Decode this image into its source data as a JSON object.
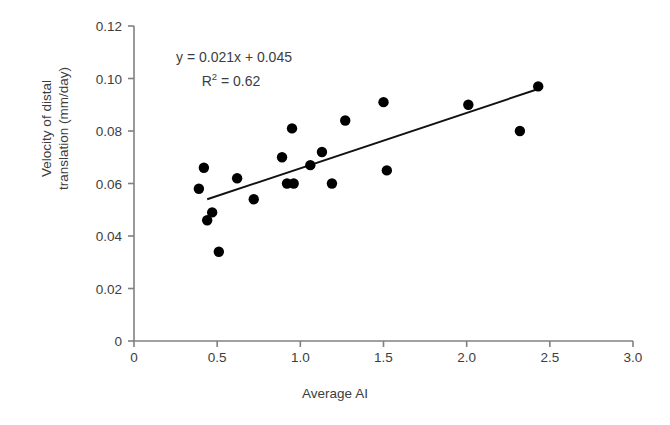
{
  "chart_data": {
    "type": "scatter",
    "title": "",
    "xlabel": "Average AI",
    "ylabel": "Velocity of distal translation (mm/day)",
    "ylabel_line1": "Velocity of distal",
    "ylabel_line2": "translation (mm/day)",
    "xlim": [
      0,
      3.0
    ],
    "ylim": [
      0,
      0.12
    ],
    "xticks": [
      "0",
      "0.5",
      "1.0",
      "1.5",
      "2.0",
      "2.5",
      "3.0"
    ],
    "xtick_values": [
      0,
      0.5,
      1.0,
      1.5,
      2.0,
      2.5,
      3.0
    ],
    "yticks": [
      "0",
      "0.02",
      "0.04",
      "0.06",
      "0.08",
      "0.10",
      "0.12"
    ],
    "ytick_values": [
      0,
      0.02,
      0.04,
      0.06,
      0.08,
      0.1,
      0.12
    ],
    "grid": false,
    "legend": null,
    "marker": "filled-circle",
    "marker_color": "#000000",
    "axis_color": "#808080",
    "points": [
      {
        "x": 0.39,
        "y": 0.058
      },
      {
        "x": 0.42,
        "y": 0.066
      },
      {
        "x": 0.44,
        "y": 0.046
      },
      {
        "x": 0.47,
        "y": 0.049
      },
      {
        "x": 0.51,
        "y": 0.034
      },
      {
        "x": 0.62,
        "y": 0.062
      },
      {
        "x": 0.72,
        "y": 0.054
      },
      {
        "x": 0.89,
        "y": 0.07
      },
      {
        "x": 0.92,
        "y": 0.06
      },
      {
        "x": 0.96,
        "y": 0.06
      },
      {
        "x": 0.95,
        "y": 0.081
      },
      {
        "x": 1.06,
        "y": 0.067
      },
      {
        "x": 1.13,
        "y": 0.072
      },
      {
        "x": 1.19,
        "y": 0.06
      },
      {
        "x": 1.27,
        "y": 0.084
      },
      {
        "x": 1.5,
        "y": 0.091
      },
      {
        "x": 1.52,
        "y": 0.065
      },
      {
        "x": 2.01,
        "y": 0.09
      },
      {
        "x": 2.32,
        "y": 0.08
      },
      {
        "x": 2.43,
        "y": 0.097
      }
    ],
    "trendline": {
      "x1": 0.44,
      "y1": 0.054,
      "x2": 2.43,
      "y2": 0.096,
      "slope": 0.021,
      "intercept": 0.045
    },
    "annotation": {
      "equation": "y = 0.021x + 0.045",
      "r2_prefix": "R",
      "r2_exponent": "2",
      "r2_value": " = 0.62"
    }
  }
}
